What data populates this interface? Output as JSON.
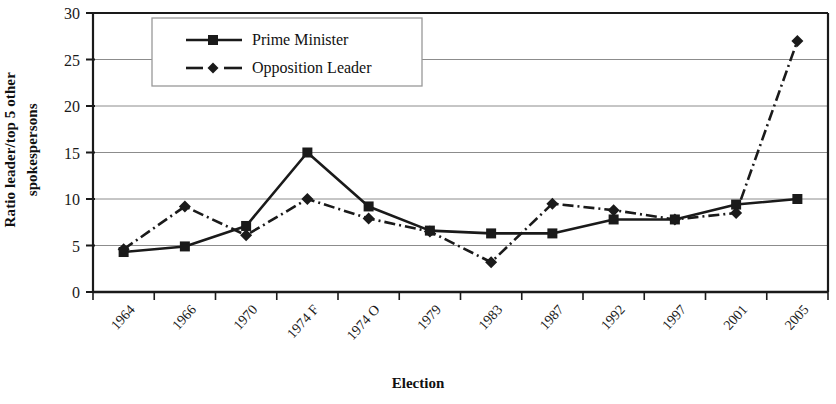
{
  "chart_data": {
    "type": "line",
    "title": "",
    "xlabel": "Election",
    "ylabel_line1": "Ratio leader/top 5 other",
    "ylabel_line2": "spokespersons",
    "categories": [
      "1964",
      "1966",
      "1970",
      "1974 F",
      "1974 O",
      "1979",
      "1983",
      "1987",
      "1992",
      "1997",
      "2001",
      "2005"
    ],
    "ylim": [
      0,
      30
    ],
    "yticks": [
      0,
      5,
      10,
      15,
      20,
      25,
      30
    ],
    "grid": true,
    "legend_position": "top-left-inside",
    "series": [
      {
        "name": "Prime Minister",
        "marker": "square",
        "line_style": "solid",
        "color": "#1a1a1a",
        "values": [
          4.3,
          4.9,
          7.1,
          15.0,
          9.2,
          6.6,
          6.3,
          6.3,
          7.8,
          7.8,
          9.4,
          10.0
        ]
      },
      {
        "name": "Opposition Leader",
        "marker": "diamond",
        "line_style": "dash-dot",
        "color": "#1a1a1a",
        "values": [
          4.6,
          9.2,
          6.1,
          10.0,
          7.9,
          6.5,
          3.2,
          9.5,
          8.8,
          7.8,
          8.5,
          27.0
        ]
      }
    ]
  },
  "legend": {
    "entries": [
      "Prime Minister",
      "Opposition Leader"
    ]
  }
}
